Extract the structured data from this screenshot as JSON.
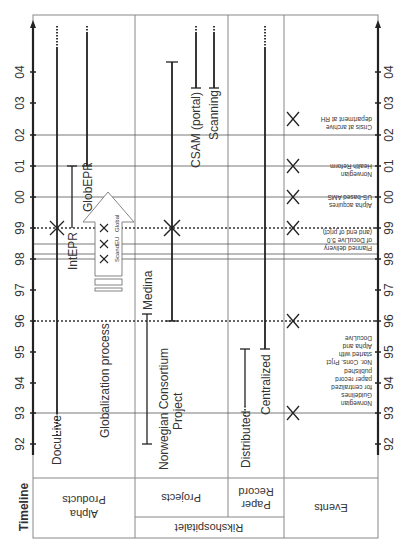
{
  "title": "Timeline",
  "axis": {
    "years": [
      "92",
      "93",
      "94",
      "95",
      "96",
      "97",
      "98",
      "99",
      "00",
      "01",
      "02",
      "03",
      "04"
    ]
  },
  "columns": {
    "alpha": "Alpha Products",
    "alpha_l1": "Alpha",
    "alpha_l2": "Products",
    "projects": "Projects",
    "paper_l1": "Paper",
    "paper_l2": "Record",
    "rikshospitalet": "Rikshospitalet",
    "events": "Events"
  },
  "alpha_products": {
    "doculive": "DocuLive",
    "globalization": "Globalization process",
    "intepr": "IntEPR",
    "globepr": "GlobEPR",
    "arrow_stages": [
      "Scand.",
      "EU",
      "Global"
    ]
  },
  "projects": {
    "nor_cons_l1": "Norwegian Consortium",
    "nor_cons_l2": "Project",
    "medina": "Medina",
    "csam": "CSAM (portal)",
    "scanning": "Scanning"
  },
  "paper_record": {
    "distributed": "Distributed",
    "centralized": "Centralized"
  },
  "events": [
    {
      "year": "93",
      "lines": [
        "Norwegian",
        "Guidelines",
        "for centralized",
        "paper record",
        "published"
      ]
    },
    {
      "year": "96",
      "lines": [
        "Nor. Cons. Prjct",
        "started with",
        "Alpha and",
        "DocuLive"
      ]
    },
    {
      "year": "99",
      "lines": [
        "Planned delivery",
        "of DocuLive 5.0",
        "(and end of prjct)"
      ]
    },
    {
      "year": "00",
      "lines": [
        "Alpha acquires",
        "US-based AMS"
      ]
    },
    {
      "year": "01",
      "lines": [
        "Norwegian",
        "Health Reform"
      ]
    },
    {
      "year": "02.5",
      "lines": [
        "Crisis at archive",
        "department at RH"
      ]
    }
  ]
}
